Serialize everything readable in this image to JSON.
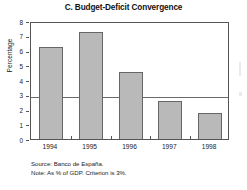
{
  "chart_data": {
    "type": "bar",
    "title": "C. Budget-Deficit Convergence",
    "xlabel": "",
    "ylabel": "Percentage",
    "categories": [
      "1994",
      "1995",
      "1996",
      "1997",
      "1998"
    ],
    "values": [
      6.4,
      7.4,
      4.7,
      2.7,
      1.9
    ],
    "ylim": [
      0,
      8
    ],
    "ytick_labels": [
      "0",
      "1",
      "2",
      "3",
      "4",
      "5",
      "6",
      "7",
      "8"
    ],
    "ytick_values": [
      0,
      1,
      2,
      3,
      4,
      5,
      6,
      7,
      8
    ],
    "grid": false,
    "legend": "none",
    "reference_line": {
      "label": "Criterion",
      "value": 3
    },
    "bar_color": "#b9b9b9",
    "bar_border_color": "#666666",
    "axis_color": "#555555",
    "reference_line_color": "#6b6b6b"
  },
  "footnotes": [
    "Source: Banco de España.",
    "Note: As % of GDP. Criterion is 3%."
  ]
}
